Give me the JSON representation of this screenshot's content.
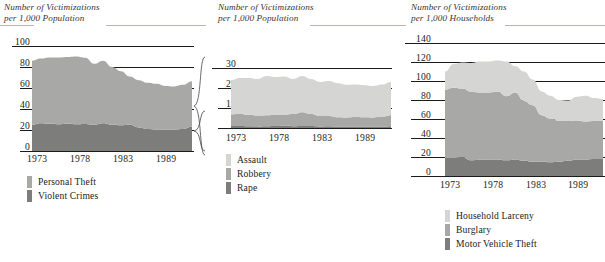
{
  "figure": {
    "background": "#ffffff",
    "palette": {
      "light": "#d5d5d3",
      "medium": "#a8a8a6",
      "dark": "#7d7d7b",
      "gridline": "#1d1b19",
      "title_rule": "#b9b4ae",
      "text": "#201d1b"
    }
  },
  "charts": [
    {
      "id": "personal-crimes",
      "type": "area",
      "stacked": true,
      "title_line1": "Number of Victimizations",
      "title_line2": "per 1,000 Population",
      "ylabel": "",
      "xlabel": "",
      "ylim": [
        0,
        100
      ],
      "yticks": [
        "0",
        "20",
        "40",
        "60",
        "80",
        "100"
      ],
      "ytick_values": [
        0,
        20,
        40,
        60,
        80,
        100
      ],
      "grid": true,
      "xticks": [
        "1973",
        "1978",
        "1983",
        "1989"
      ],
      "xtick_values": [
        1973,
        1978,
        1983,
        1989
      ],
      "x": [
        1973,
        1974,
        1975,
        1976,
        1977,
        1978,
        1979,
        1980,
        1981,
        1982,
        1983,
        1984,
        1985,
        1986,
        1987,
        1988,
        1989,
        1990,
        1991
      ],
      "series": [
        {
          "name": "Violent Crimes",
          "color": "#7d7d7b",
          "values": [
            25.0,
            26.5,
            26.0,
            25.5,
            26.0,
            25.5,
            25.8,
            25.0,
            26.5,
            25.0,
            24.5,
            25.0,
            22.5,
            21.0,
            20.5,
            20.5,
            20.5,
            21.0,
            23.0
          ]
        },
        {
          "name": "Personal Theft",
          "color": "#a8a8a6",
          "values": [
            61.0,
            61.5,
            63.0,
            63.5,
            63.5,
            64.5,
            63.0,
            58.0,
            59.5,
            55.0,
            51.5,
            46.0,
            45.0,
            44.0,
            43.5,
            41.5,
            41.0,
            42.0,
            43.5
          ]
        }
      ],
      "legend": [
        {
          "label": "Personal Theft",
          "color": "#a8a8a6"
        },
        {
          "label": "Violent Crimes",
          "color": "#7d7d7b"
        }
      ]
    },
    {
      "id": "violent-crime-detail",
      "type": "area",
      "stacked": true,
      "title_line1": "Number of Victimizations",
      "title_line2": "per 1,000 Population",
      "ylabel": "",
      "xlabel": "",
      "ylim": [
        0,
        30
      ],
      "yticks": [
        "0",
        "10",
        "20",
        "30"
      ],
      "ytick_values": [
        0,
        10,
        20,
        30
      ],
      "grid": true,
      "xticks": [
        "1973",
        "1978",
        "1983",
        "1989"
      ],
      "xtick_values": [
        1973,
        1978,
        1983,
        1989
      ],
      "x": [
        1973,
        1974,
        1975,
        1976,
        1977,
        1978,
        1979,
        1980,
        1981,
        1982,
        1983,
        1984,
        1985,
        1986,
        1987,
        1988,
        1989,
        1990,
        1991
      ],
      "series": [
        {
          "name": "Rape",
          "color": "#7d7d7b",
          "values": [
            1.0,
            1.0,
            0.9,
            0.8,
            0.9,
            1.0,
            1.1,
            0.9,
            1.0,
            1.0,
            0.8,
            0.9,
            0.7,
            0.7,
            0.8,
            0.8,
            0.8,
            0.7,
            0.9
          ]
        },
        {
          "name": "Robbery",
          "color": "#a8a8a6",
          "values": [
            5.9,
            6.0,
            5.7,
            5.4,
            5.5,
            5.5,
            5.6,
            6.1,
            6.9,
            6.0,
            5.2,
            5.1,
            4.7,
            4.6,
            4.7,
            4.6,
            4.5,
            5.0,
            5.5
          ]
        },
        {
          "name": "Assault",
          "color": "#d5d5d3",
          "values": [
            17.1,
            18.0,
            18.4,
            18.3,
            19.6,
            19.0,
            19.1,
            17.5,
            18.1,
            17.5,
            17.0,
            17.5,
            17.0,
            16.3,
            16.2,
            16.0,
            15.7,
            16.0,
            16.6
          ]
        }
      ],
      "legend": [
        {
          "label": "Assault",
          "color": "#d5d5d3"
        },
        {
          "label": "Robbery",
          "color": "#a8a8a6"
        },
        {
          "label": "Rape",
          "color": "#7d7d7b"
        }
      ]
    },
    {
      "id": "household-crimes",
      "type": "area",
      "stacked": true,
      "title_line1": "Number of Victimizations",
      "title_line2": "per 1,000 Households",
      "ylabel": "",
      "xlabel": "",
      "ylim": [
        0,
        140
      ],
      "yticks": [
        "0",
        "20",
        "40",
        "60",
        "80",
        "100",
        "120",
        "140"
      ],
      "ytick_values": [
        0,
        20,
        40,
        60,
        80,
        100,
        120,
        140
      ],
      "grid": true,
      "xticks": [
        "1973",
        "1978",
        "1983",
        "1989"
      ],
      "xtick_values": [
        1973,
        1978,
        1983,
        1989
      ],
      "x": [
        1973,
        1974,
        1975,
        1976,
        1977,
        1978,
        1979,
        1980,
        1981,
        1982,
        1983,
        1984,
        1985,
        1986,
        1987,
        1988,
        1989,
        1990,
        1991
      ],
      "series": [
        {
          "name": "Motor Vehicle Theft",
          "color": "#7d7d7b",
          "values": [
            19.0,
            19.0,
            19.5,
            16.5,
            17.0,
            17.5,
            17.5,
            16.5,
            17.5,
            16.0,
            15.0,
            15.0,
            14.5,
            15.0,
            16.0,
            17.5,
            17.5,
            18.0,
            18.0
          ]
        },
        {
          "name": "Burglary",
          "color": "#a8a8a6",
          "values": [
            72.0,
            74.0,
            72.5,
            72.0,
            71.0,
            70.5,
            71.5,
            67.5,
            70.5,
            63.0,
            59.5,
            49.0,
            46.0,
            43.0,
            42.0,
            41.0,
            40.0,
            40.0,
            40.0
          ]
        },
        {
          "name": "Household Larceny",
          "color": "#d5d5d3",
          "values": [
            19.0,
            25.0,
            27.5,
            30.5,
            32.5,
            32.5,
            32.5,
            36.5,
            27.5,
            31.0,
            27.0,
            25.0,
            24.0,
            22.0,
            21.5,
            25.0,
            27.0,
            24.0,
            23.0
          ]
        }
      ],
      "legend": [
        {
          "label": "Household Larceny",
          "color": "#d5d5d3"
        },
        {
          "label": "Burglary",
          "color": "#a8a8a6"
        },
        {
          "label": "Motor Vehicle Theft",
          "color": "#7d7d7b"
        }
      ]
    }
  ]
}
